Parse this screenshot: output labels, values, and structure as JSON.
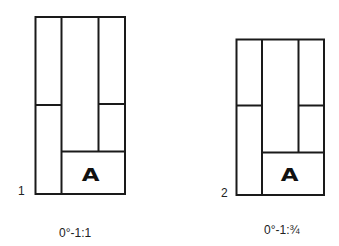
{
  "figures": [
    {
      "number": "1",
      "caption": "0°-1:1",
      "panel_label": "A"
    },
    {
      "number": "2",
      "caption": "0°-1:¾",
      "panel_label": "A"
    }
  ],
  "colors": {
    "line": "#1a1a1a",
    "background": "#ffffff"
  }
}
